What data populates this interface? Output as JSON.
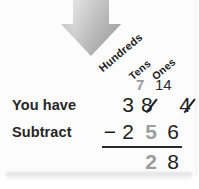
{
  "page": {
    "background": "#ffffff",
    "card_background": "#fcfcfc"
  },
  "arrow": {
    "name": "down-arrow",
    "direction": "down",
    "color_top": "#e8e8e8",
    "color_bottom": "#8e8e8e"
  },
  "colors": {
    "text_dark": "#1f1f1f",
    "text_gray": "#9d9d9d",
    "label": "#262626",
    "rule": "#2a2a2a"
  },
  "headers": {
    "hundreds": "Hundreds",
    "tens": "Tens",
    "ones": "Ones"
  },
  "regroup": {
    "tens_mark": "7",
    "ones_mark": "14"
  },
  "labels": {
    "you_have": "You have",
    "subtract": "Subtract"
  },
  "minuend": {
    "hundreds": "3",
    "tens": "8",
    "ones": "4"
  },
  "subtrahend": {
    "operator": "−",
    "hundreds": "2",
    "tens": "5",
    "ones": "6"
  },
  "answer": {
    "tens": "2",
    "ones": "8"
  }
}
